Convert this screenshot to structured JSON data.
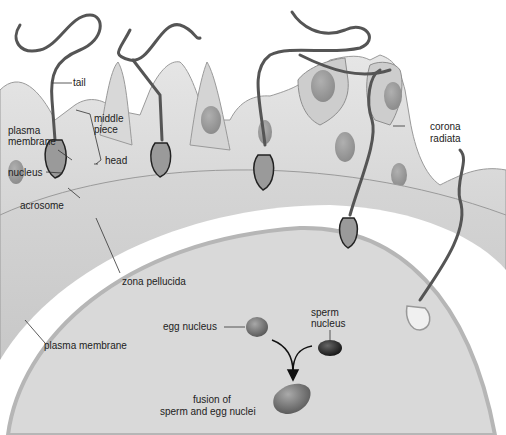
{
  "diagram": {
    "colors": {
      "background": "#ffffff",
      "corona": "#cfcfcf",
      "corona_shadow": "#a9a9a9",
      "cell_nucleus": "#9a9a9a",
      "zona": "#c8c8c8",
      "zona_white": "#ffffff",
      "egg": "#d9d9d9",
      "egg_membrane": "#bdbdbd",
      "sperm_tail": "#555555",
      "egg_nucleus": "#7a7a7a",
      "sperm_nucleus": "#2e2e2e",
      "fused_nucleus": "#7d7d7d",
      "leader": "#333333"
    },
    "labels": {
      "tail": "tail",
      "middle_piece_1": "middle",
      "middle_piece_2": "piece",
      "plasma_membrane_sperm_1": "plasma",
      "plasma_membrane_sperm_2": "membrane",
      "head": "head",
      "nucleus": "nucleus",
      "acrosome": "acrosome",
      "corona_radiata_1": "corona",
      "corona_radiata_2": "radiata",
      "zona_pellucida": "zona pellucida",
      "egg_nucleus": "egg nucleus",
      "sperm_nucleus_1": "sperm",
      "sperm_nucleus_2": "nucleus",
      "plasma_membrane_egg": "plasma membrane",
      "fusion_1": "fusion of",
      "fusion_2": "sperm and egg nuclei"
    }
  }
}
